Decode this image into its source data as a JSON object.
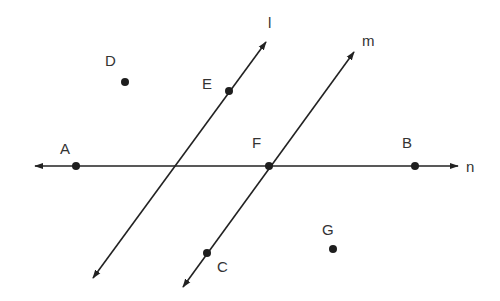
{
  "diagram": {
    "colors": {
      "line": "#222222",
      "point": "#1e1e1e",
      "label": "#333333",
      "background": "#ffffff"
    },
    "lines": [
      {
        "name": "n",
        "label": "n",
        "x1": 35,
        "y1": 166,
        "x2": 458,
        "y2": 166,
        "label_x": 466,
        "label_y": 172
      },
      {
        "name": "l",
        "label": "l",
        "x1": 93,
        "y1": 278,
        "x2": 266,
        "y2": 42,
        "label_x": 268,
        "label_y": 28
      },
      {
        "name": "m",
        "label": "m",
        "x1": 183,
        "y1": 287,
        "x2": 354,
        "y2": 52,
        "label_x": 362,
        "label_y": 46
      }
    ],
    "points": [
      {
        "name": "A",
        "label": "A",
        "x": 76,
        "y": 166,
        "label_x": 60,
        "label_y": 154
      },
      {
        "name": "B",
        "label": "B",
        "x": 415,
        "y": 166,
        "label_x": 402,
        "label_y": 148
      },
      {
        "name": "F",
        "label": "F",
        "x": 269,
        "y": 166,
        "label_x": 252,
        "label_y": 148
      },
      {
        "name": "E",
        "label": "E",
        "x": 229,
        "y": 91,
        "label_x": 202,
        "label_y": 89
      },
      {
        "name": "C",
        "label": "C",
        "x": 207,
        "y": 253,
        "label_x": 217,
        "label_y": 272
      },
      {
        "name": "D",
        "label": "D",
        "x": 125,
        "y": 82,
        "label_x": 105,
        "label_y": 66
      },
      {
        "name": "G",
        "label": "G",
        "x": 333,
        "y": 249,
        "label_x": 322,
        "label_y": 235
      }
    ]
  }
}
